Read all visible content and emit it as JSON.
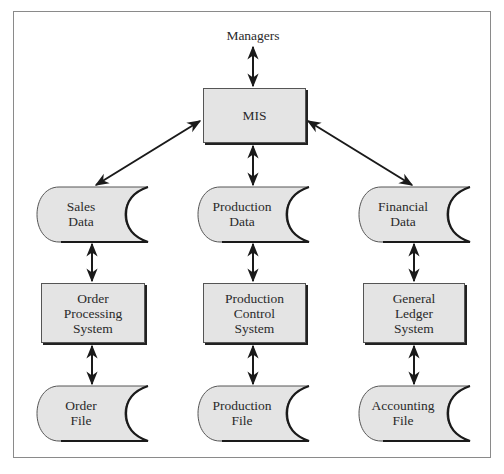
{
  "diagram": {
    "top_label": "Managers",
    "center": {
      "label": "MIS"
    },
    "columns": [
      {
        "data_store": {
          "line1": "Sales",
          "line2": "Data"
        },
        "system": {
          "line1": "Order",
          "line2": "Processing",
          "line3": "System"
        },
        "file": {
          "line1": "Order",
          "line2": "File"
        }
      },
      {
        "data_store": {
          "line1": "Production",
          "line2": "Data"
        },
        "system": {
          "line1": "Production",
          "line2": "Control",
          "line3": "System"
        },
        "file": {
          "line1": "Production",
          "line2": "File"
        }
      },
      {
        "data_store": {
          "line1": "Financial",
          "line2": "Data"
        },
        "system": {
          "line1": "General",
          "line2": "Ledger",
          "line3": "System"
        },
        "file": {
          "line1": "Accounting",
          "line2": "File"
        }
      }
    ],
    "colors": {
      "fill": "#e4e4e4",
      "stroke": "#1a1a1a",
      "frame": "#8a8a8a"
    }
  }
}
